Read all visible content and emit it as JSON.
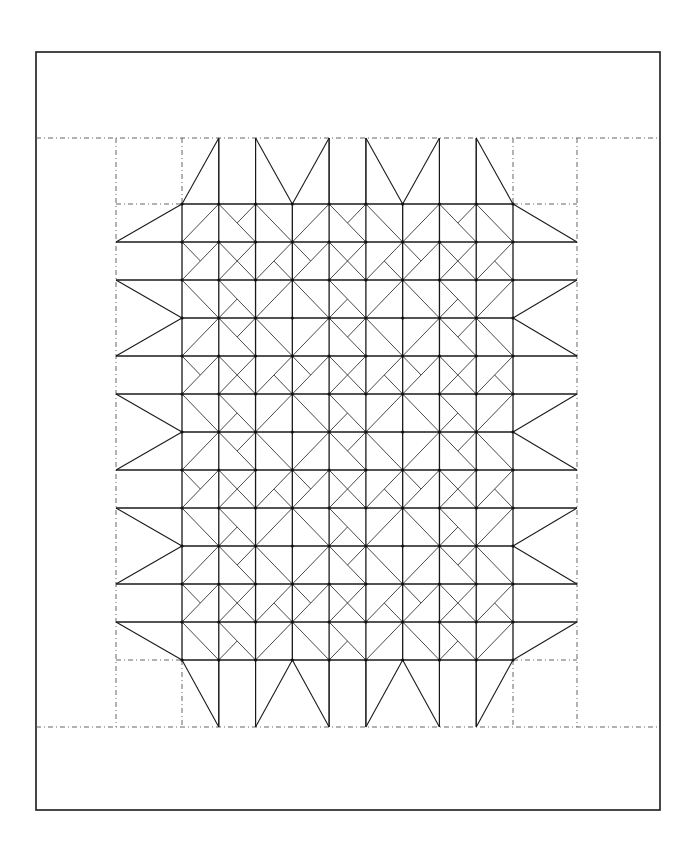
{
  "diagram": {
    "colors": {
      "line": "#1a1a1a",
      "dashed": "#555555",
      "background": "#ffffff"
    },
    "outer_border": {
      "x1": 36,
      "y1": 52,
      "x2": 660,
      "y2": 810
    },
    "border_dashes": {
      "top_y": 138,
      "bottom_y": 727,
      "left_x": 116,
      "right_x": 577
    },
    "center_grid": {
      "x0": 182,
      "y0": 204,
      "x1": 513,
      "y1": 660,
      "cols": 9,
      "rows": 12,
      "block_size": 3,
      "block_pattern": [
        {
          "cell": [
            0,
            0
          ],
          "lines": [
            [
              [
                0,
                1
              ],
              [
                1,
                0
              ]
            ]
          ]
        },
        {
          "cell": [
            1,
            0
          ],
          "lines": [
            [
              [
                0,
                0
              ],
              [
                1,
                1
              ]
            ],
            [
              [
                1,
                0
              ],
              [
                0.5,
                0.5
              ]
            ]
          ]
        },
        {
          "cell": [
            2,
            0
          ],
          "lines": [
            [
              [
                0,
                0
              ],
              [
                1,
                1
              ]
            ]
          ]
        },
        {
          "cell": [
            0,
            1
          ],
          "lines": [
            [
              [
                0,
                1
              ],
              [
                1,
                0
              ]
            ],
            [
              [
                0,
                0
              ],
              [
                0.5,
                0.5
              ]
            ]
          ]
        },
        {
          "cell": [
            1,
            1
          ],
          "lines": [
            [
              [
                0,
                0
              ],
              [
                1,
                1
              ]
            ],
            [
              [
                0,
                1
              ],
              [
                1,
                0
              ]
            ]
          ]
        },
        {
          "cell": [
            2,
            1
          ],
          "lines": [
            [
              [
                0,
                1
              ],
              [
                1,
                0
              ]
            ],
            [
              [
                0.5,
                0.5
              ],
              [
                1,
                1
              ]
            ]
          ]
        },
        {
          "cell": [
            0,
            2
          ],
          "lines": [
            [
              [
                0,
                0
              ],
              [
                1,
                1
              ]
            ]
          ]
        },
        {
          "cell": [
            1,
            2
          ],
          "lines": [
            [
              [
                0,
                0
              ],
              [
                1,
                1
              ]
            ],
            [
              [
                0,
                1
              ],
              [
                0.5,
                0.5
              ]
            ]
          ]
        },
        {
          "cell": [
            2,
            2
          ],
          "lines": [
            [
              [
                0,
                1
              ],
              [
                1,
                0
              ]
            ]
          ]
        }
      ]
    },
    "top_points": {
      "apex_y": 138,
      "columns": [
        {
          "col": 0,
          "type": "tri-right"
        },
        {
          "col": 1,
          "type": "rect"
        },
        {
          "col": 2,
          "type": "tri-left"
        },
        {
          "col": 3,
          "type": "tri-right"
        },
        {
          "col": 4,
          "type": "rect"
        },
        {
          "col": 5,
          "type": "tri-left"
        },
        {
          "col": 6,
          "type": "tri-right"
        },
        {
          "col": 7,
          "type": "rect"
        },
        {
          "col": 8,
          "type": "tri-left"
        }
      ]
    },
    "side_points": {
      "row_types": [
        "tri-bottom",
        "rect",
        "tri-top",
        "tri-bottom",
        "rect",
        "tri-top",
        "tri-bottom",
        "rect",
        "tri-top",
        "tri-bottom",
        "rect",
        "tri-top"
      ]
    },
    "labels": {
      "outer_border": "Outer border",
      "inner_border": "Pieced border (flying geese points)",
      "center": "Pinwheel block center (3 x 4 blocks)"
    }
  }
}
